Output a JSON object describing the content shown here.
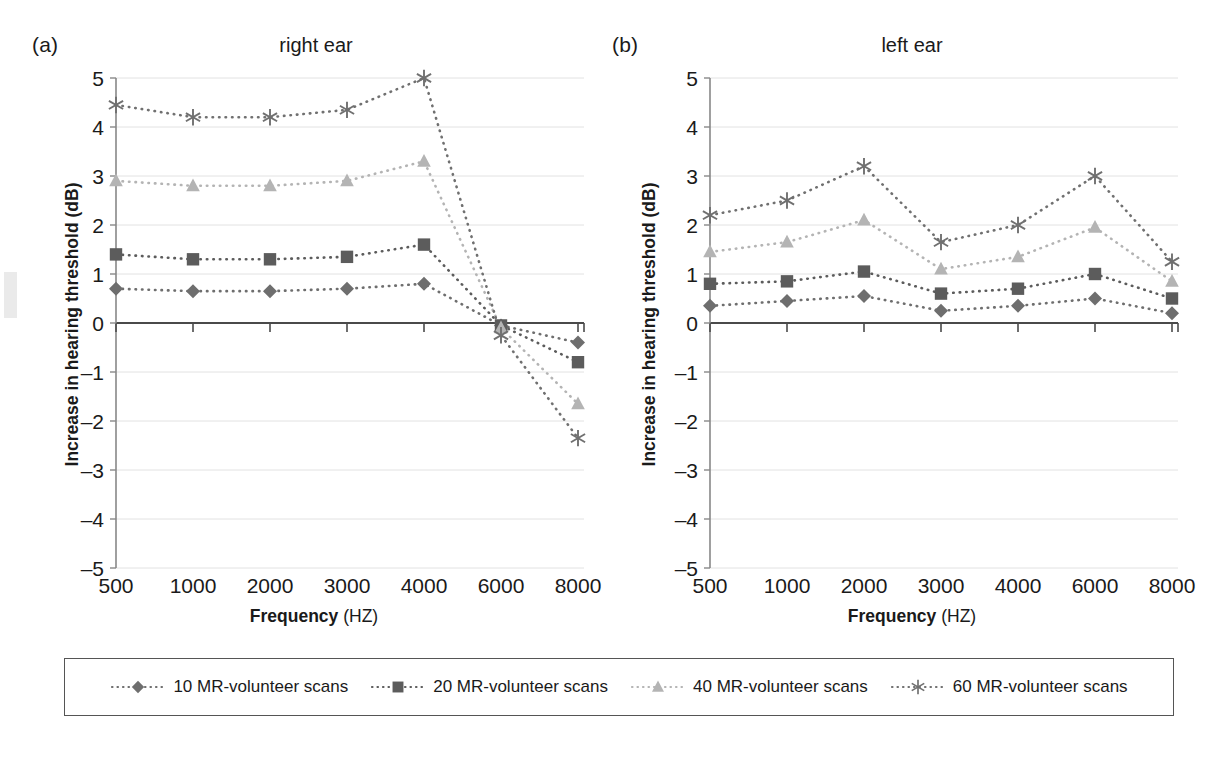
{
  "figure": {
    "background": "#ffffff",
    "width": 1232,
    "height": 760
  },
  "panels": [
    {
      "tag": "(a)",
      "title": "right ear"
    },
    {
      "tag": "(b)",
      "title": "left ear"
    }
  ],
  "axis": {
    "xlabel_bold": "Frequency",
    "xlabel_unit": " (HZ)",
    "ylabel": "Increase in hearing threshold (dB)",
    "yticks": [
      "5",
      "4",
      "3",
      "2",
      "1",
      "0",
      "–1",
      "–2",
      "–3",
      "–4",
      "–5"
    ],
    "xticks": [
      "500",
      "1000",
      "2000",
      "3000",
      "4000",
      "6000",
      "8000"
    ]
  },
  "legend": {
    "entries": [
      {
        "label": "10 MR-volunteer scans",
        "marker": "diamond",
        "color": "#6e6e6e"
      },
      {
        "label": "20 MR-volunteer scans",
        "marker": "square",
        "color": "#5c5c5c"
      },
      {
        "label": "40 MR-volunteer scans",
        "marker": "triangle",
        "color": "#b4b4b4"
      },
      {
        "label": "60 MR-volunteer scans",
        "marker": "asterisk",
        "color": "#707070"
      }
    ]
  },
  "chart_data": [
    {
      "type": "line",
      "title": "right ear",
      "panel": "(a)",
      "xlabel": "Frequency (HZ)",
      "ylabel": "Increase in hearing threshold (dB)",
      "categories": [
        500,
        1000,
        2000,
        3000,
        4000,
        6000,
        8000
      ],
      "ylim": [
        -5,
        5
      ],
      "grid": true,
      "legend_position": "bottom",
      "series": [
        {
          "name": "10 MR-volunteer scans",
          "marker": "diamond",
          "color": "#6e6e6e",
          "values": [
            0.7,
            0.65,
            0.65,
            0.7,
            0.8,
            -0.05,
            -0.4
          ]
        },
        {
          "name": "20 MR-volunteer scans",
          "marker": "square",
          "color": "#5c5c5c",
          "values": [
            1.4,
            1.3,
            1.3,
            1.35,
            1.6,
            -0.05,
            -0.8
          ]
        },
        {
          "name": "40 MR-volunteer scans",
          "marker": "triangle",
          "color": "#b4b4b4",
          "values": [
            2.9,
            2.8,
            2.8,
            2.9,
            3.3,
            -0.1,
            -1.65
          ]
        },
        {
          "name": "60 MR-volunteer scans",
          "marker": "asterisk",
          "color": "#707070",
          "values": [
            4.45,
            4.2,
            4.2,
            4.35,
            5.0,
            -0.25,
            -2.35
          ]
        }
      ]
    },
    {
      "type": "line",
      "title": "left ear",
      "panel": "(b)",
      "xlabel": "Frequency (HZ)",
      "ylabel": "Increase in hearing threshold (dB)",
      "categories": [
        500,
        1000,
        2000,
        3000,
        4000,
        6000,
        8000
      ],
      "ylim": [
        -5,
        5
      ],
      "grid": true,
      "legend_position": "bottom",
      "series": [
        {
          "name": "10 MR-volunteer scans",
          "marker": "diamond",
          "color": "#6e6e6e",
          "values": [
            0.35,
            0.45,
            0.55,
            0.25,
            0.35,
            0.5,
            0.2
          ]
        },
        {
          "name": "20 MR-volunteer scans",
          "marker": "square",
          "color": "#5c5c5c",
          "values": [
            0.8,
            0.85,
            1.05,
            0.6,
            0.7,
            1.0,
            0.5
          ]
        },
        {
          "name": "40 MR-volunteer scans",
          "marker": "triangle",
          "color": "#b4b4b4",
          "values": [
            1.45,
            1.65,
            2.1,
            1.1,
            1.35,
            1.95,
            0.85
          ]
        },
        {
          "name": "60 MR-volunteer scans",
          "marker": "asterisk",
          "color": "#707070",
          "values": [
            2.2,
            2.5,
            3.2,
            1.65,
            2.0,
            3.0,
            1.25
          ]
        }
      ]
    }
  ]
}
